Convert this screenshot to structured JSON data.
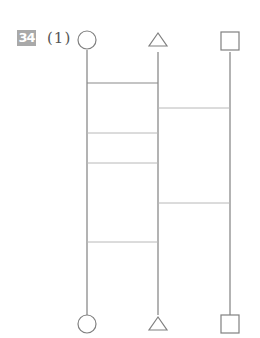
{
  "problem": {
    "number": "34",
    "sub_label": "(1)"
  },
  "diagram": {
    "type": "amidakuji-ladder",
    "columns": [
      {
        "name": "circle",
        "x": 87,
        "top_symbol": "circle",
        "bottom_symbol": "circle"
      },
      {
        "name": "triangle",
        "x": 158,
        "top_symbol": "triangle",
        "bottom_symbol": "triangle"
      },
      {
        "name": "square",
        "x": 230,
        "top_symbol": "square",
        "bottom_symbol": "square"
      }
    ],
    "rungs": [
      {
        "between": [
          "circle",
          "triangle"
        ],
        "y": 83
      },
      {
        "between": [
          "triangle",
          "square"
        ],
        "y": 108
      },
      {
        "between": [
          "circle",
          "triangle"
        ],
        "y": 133
      },
      {
        "between": [
          "circle",
          "triangle"
        ],
        "y": 163
      },
      {
        "between": [
          "triangle",
          "square"
        ],
        "y": 203
      },
      {
        "between": [
          "circle",
          "triangle"
        ],
        "y": 242
      }
    ],
    "line_top_y": 52,
    "line_bottom_y": 314,
    "colors": {
      "vertical": "#808080",
      "rung": "#b8b8b8",
      "shape": "#808080",
      "badge": "#a9a9a9"
    }
  }
}
